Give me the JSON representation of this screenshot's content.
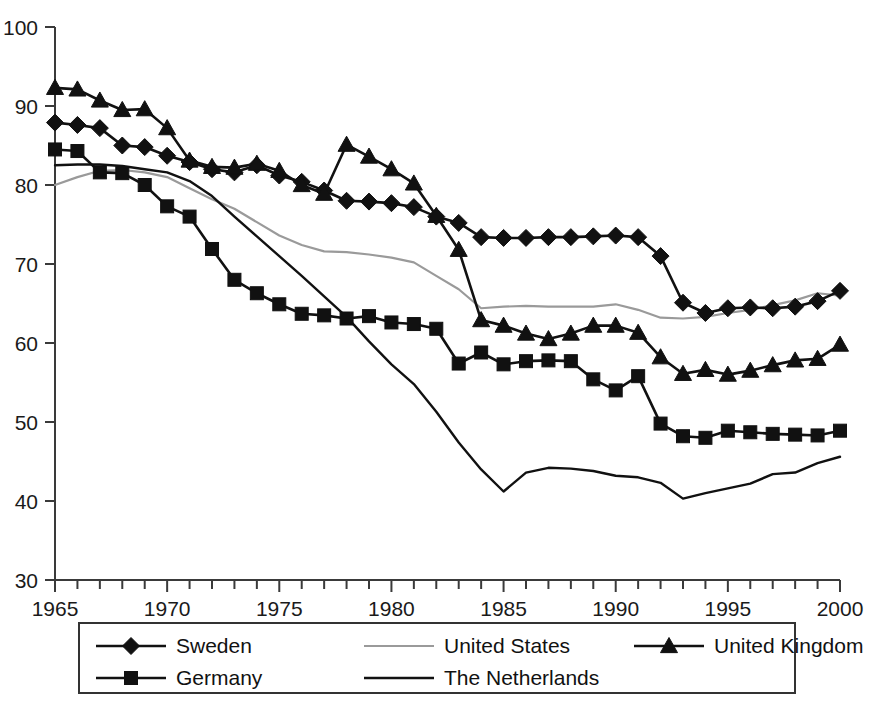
{
  "chart_data": {
    "type": "line",
    "title": "",
    "subtitle": "",
    "xlabel": "",
    "ylabel": "",
    "xlim": [
      1965,
      2000
    ],
    "ylim": [
      30,
      100
    ],
    "grid": false,
    "legend_position": "bottom",
    "x_ticks": [
      "1965",
      "1970",
      "1975",
      "1980",
      "1985",
      "1990",
      "1995",
      "2000"
    ],
    "x_tick_values": [
      1965,
      1970,
      1975,
      1980,
      1985,
      1990,
      1995,
      2000
    ],
    "x_minor_step": 1,
    "y_ticks": [
      "30",
      "40",
      "50",
      "60",
      "70",
      "80",
      "90",
      "100"
    ],
    "y_tick_values": [
      30,
      40,
      50,
      60,
      70,
      80,
      90,
      100
    ],
    "x": [
      1965,
      1966,
      1967,
      1968,
      1969,
      1970,
      1971,
      1972,
      1973,
      1974,
      1975,
      1976,
      1977,
      1978,
      1979,
      1980,
      1981,
      1982,
      1983,
      1984,
      1985,
      1986,
      1987,
      1988,
      1989,
      1990,
      1991,
      1992,
      1993,
      1994,
      1995,
      1996,
      1997,
      1998,
      1999,
      2000
    ],
    "series": [
      {
        "name": "Sweden",
        "marker": "diamond",
        "color": "#111111",
        "values": [
          87.9,
          87.6,
          87.2,
          85.0,
          84.8,
          83.7,
          82.9,
          82.0,
          81.6,
          82.5,
          81.2,
          80.4,
          79.3,
          78.0,
          77.9,
          77.7,
          77.2,
          76.0,
          75.2,
          73.4,
          73.3,
          73.3,
          73.4,
          73.4,
          73.5,
          73.6,
          73.4,
          71.0,
          65.1,
          63.8,
          64.4,
          64.5,
          64.4,
          64.6,
          65.3,
          66.6
        ]
      },
      {
        "name": "United States",
        "marker": "none",
        "color": "#9a9a9a",
        "values": [
          80.0,
          81.0,
          81.8,
          81.9,
          81.6,
          81.0,
          79.6,
          78.2,
          77.0,
          75.3,
          73.6,
          72.4,
          71.6,
          71.5,
          71.2,
          70.8,
          70.2,
          68.5,
          66.8,
          64.4,
          64.6,
          64.7,
          64.6,
          64.6,
          64.6,
          64.9,
          64.2,
          63.2,
          63.1,
          63.3,
          63.8,
          64.2,
          64.8,
          65.4,
          66.3,
          66.0
        ]
      },
      {
        "name": "United Kingdom",
        "marker": "triangle",
        "color": "#111111",
        "values": [
          92.3,
          92.1,
          90.7,
          89.5,
          89.6,
          87.2,
          83.1,
          82.3,
          82.2,
          82.7,
          81.8,
          80.0,
          78.9,
          85.1,
          83.6,
          82.0,
          80.2,
          76.1,
          71.8,
          62.9,
          62.2,
          61.2,
          60.5,
          61.2,
          62.2,
          62.2,
          61.3,
          58.2,
          56.1,
          56.6,
          56.0,
          56.5,
          57.2,
          57.8,
          58.0,
          59.8
        ]
      },
      {
        "name": "Germany",
        "marker": "square",
        "color": "#111111",
        "values": [
          84.5,
          84.3,
          81.6,
          81.5,
          80.0,
          77.3,
          76.0,
          71.9,
          68.0,
          66.3,
          64.9,
          63.7,
          63.5,
          63.1,
          63.4,
          62.6,
          62.4,
          61.8,
          57.4,
          58.8,
          57.3,
          57.7,
          57.8,
          57.7,
          55.4,
          54.0,
          55.8,
          49.8,
          48.2,
          48.0,
          48.9,
          48.7,
          48.5,
          48.4,
          48.3,
          48.9
        ]
      },
      {
        "name": "The Netherlands",
        "marker": "none",
        "color": "#111111",
        "values": [
          82.5,
          82.6,
          82.6,
          82.4,
          82.0,
          81.6,
          80.5,
          78.6,
          76.0,
          73.5,
          71.0,
          68.5,
          65.9,
          63.3,
          60.2,
          57.3,
          54.8,
          51.3,
          47.4,
          44.0,
          41.2,
          43.6,
          44.2,
          44.1,
          43.8,
          43.2,
          43.0,
          42.3,
          40.3,
          41.0,
          41.6,
          42.2,
          43.4,
          43.6,
          44.8,
          45.6
        ]
      }
    ]
  },
  "legend": {
    "entries": [
      {
        "label": "Sweden",
        "marker": "diamond",
        "color": "#111111"
      },
      {
        "label": "United States",
        "marker": "none",
        "color": "#9a9a9a"
      },
      {
        "label": "United Kingdom",
        "marker": "triangle",
        "color": "#111111"
      },
      {
        "label": "Germany",
        "marker": "square",
        "color": "#111111"
      },
      {
        "label": "The Netherlands",
        "marker": "none",
        "color": "#111111"
      }
    ]
  }
}
